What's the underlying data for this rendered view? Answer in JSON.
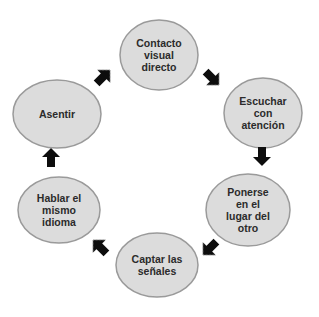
{
  "diagram": {
    "type": "cycle",
    "colors": {
      "node_fill": "#dcdcdc",
      "node_stroke": "#9a9a9a",
      "arrow": "#111111",
      "text": "#2b2b2b",
      "background": "#ffffff"
    },
    "nodes": [
      {
        "id": "contacto",
        "label": "Contacto\nvisual\ndirecto",
        "cx": 159,
        "cy": 55,
        "rx": 39,
        "ry": 35
      },
      {
        "id": "escuchar",
        "label": "Escuchar\ncon\natención",
        "cx": 263,
        "cy": 113,
        "rx": 39,
        "ry": 35
      },
      {
        "id": "ponerse",
        "label": "Ponerse\nen el\nlugar del\notro",
        "cx": 248,
        "cy": 210,
        "rx": 42,
        "ry": 36
      },
      {
        "id": "captar",
        "label": "Captar las\nseñales",
        "cx": 157,
        "cy": 265,
        "rx": 41,
        "ry": 32
      },
      {
        "id": "hablar",
        "label": "Hablar el\nmismo\nidioma",
        "cx": 59,
        "cy": 210,
        "rx": 41,
        "ry": 33
      },
      {
        "id": "asentir",
        "label": "Asentir",
        "cx": 57,
        "cy": 114,
        "rx": 44,
        "ry": 34
      }
    ],
    "arrows": [
      {
        "from": "asentir",
        "to": "contacto",
        "x": 103,
        "y": 77,
        "rotation": -45
      },
      {
        "from": "contacto",
        "to": "escuchar",
        "x": 212,
        "y": 78,
        "rotation": 45
      },
      {
        "from": "escuchar",
        "to": "ponerse",
        "x": 262,
        "y": 156,
        "rotation": 90
      },
      {
        "from": "ponerse",
        "to": "captar",
        "x": 210,
        "y": 248,
        "rotation": 135
      },
      {
        "from": "captar",
        "to": "hablar",
        "x": 100,
        "y": 247,
        "rotation": -135
      },
      {
        "from": "hablar",
        "to": "asentir",
        "x": 51,
        "y": 158,
        "rotation": -90
      }
    ]
  }
}
